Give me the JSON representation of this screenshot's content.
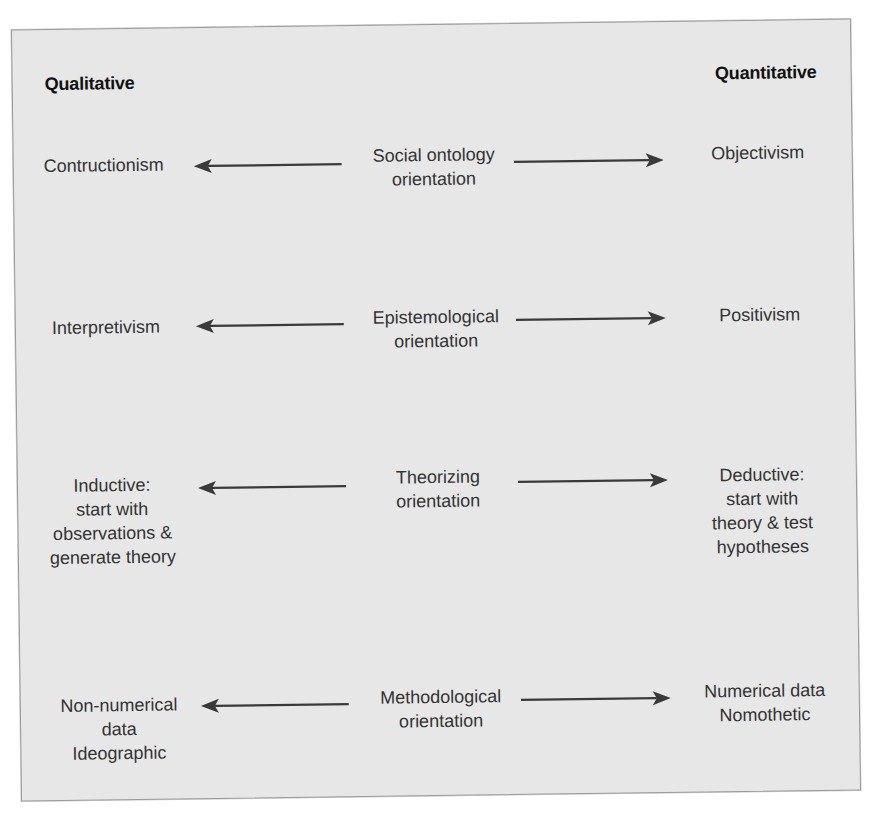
{
  "headings": {
    "left": "Qualitative",
    "right": "Quantitative"
  },
  "rows": [
    {
      "left": "Contructionism",
      "center": "Social ontology\norientation",
      "right": "Objectivism"
    },
    {
      "left": "Interpretivism",
      "center": "Epistemological\norientation",
      "right": "Positivism"
    },
    {
      "left": "Inductive:\nstart with\nobservations &\ngenerate theory",
      "center": "Theorizing\norientation",
      "right": "Deductive:\nstart with\ntheory & test\nhypotheses"
    },
    {
      "left": "Non-numerical\ndata\nIdeographic",
      "center": "Methodological\norientation",
      "right": "Numerical data\nNomothetic"
    }
  ],
  "colors": {
    "panel_background": "#e7e7e7",
    "panel_border": "#9a9a9a",
    "text": "#333333",
    "heading_text": "#111111",
    "arrow": "#3a3a3a"
  }
}
